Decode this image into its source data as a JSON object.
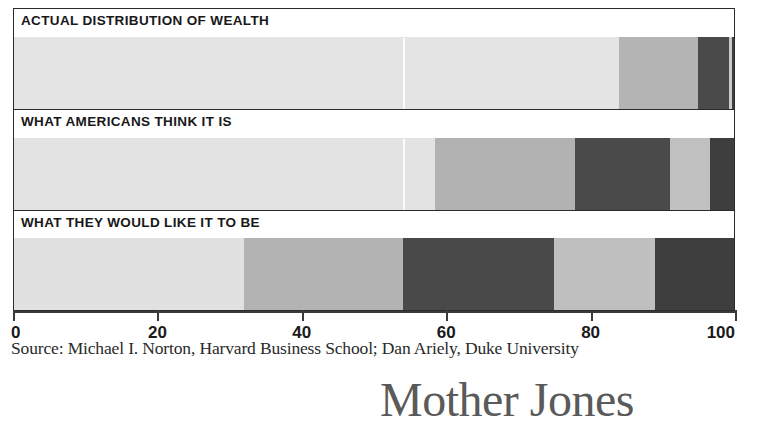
{
  "chart_data": {
    "type": "bar",
    "orientation": "horizontal",
    "stacked": true,
    "title": "",
    "xlabel": "",
    "ylabel": "",
    "xlim": [
      0,
      100
    ],
    "xticks": [
      0,
      20,
      40,
      60,
      80,
      100
    ],
    "xtick_labels": [
      "0",
      "20",
      "40",
      "60",
      "80",
      "100"
    ],
    "grid": false,
    "legend": "none",
    "categories": [
      "ACTUAL DISTRIBUTION OF WEALTH",
      "WHAT AMERICANS THINK IT IS",
      "WHAT THEY WOULD LIKE IT TO BE"
    ],
    "series": [
      {
        "name": "Top 20%",
        "values": [
          84.0,
          58.5,
          32.0
        ],
        "color": "#e3e3e3"
      },
      {
        "name": "2nd 20%",
        "values": [
          11.0,
          20.0,
          22.0
        ],
        "color": "#b6b6b6"
      },
      {
        "name": "3rd 20%",
        "values": [
          4.0,
          13.0,
          21.0
        ],
        "color": "#4a4a4a"
      },
      {
        "name": "4th 20%",
        "values": [
          0.5,
          6.0,
          14.0
        ],
        "color": "#bdbdbd"
      },
      {
        "name": "Bottom 20%",
        "values": [
          0.5,
          2.5,
          11.0
        ],
        "color": "#3f3f3f"
      }
    ],
    "source": "Source: Michael I. Norton, Harvard Business School; Dan Ariely, Duke University"
  },
  "panels": [
    {
      "label": "ACTUAL DISTRIBUTION OF WEALTH",
      "segments": [
        {
          "width": 84.0,
          "color": "#e4e4e4"
        },
        {
          "width": 11.0,
          "color": "#b4b4b4"
        },
        {
          "width": 4.3,
          "color": "#4a4a4a"
        },
        {
          "width": 0.4,
          "color": "#c9c9c9"
        },
        {
          "width": 0.3,
          "color": "#3f3f3f"
        }
      ],
      "scanline_at": 54
    },
    {
      "label": "WHAT AMERICANS THINK IT IS",
      "segments": [
        {
          "width": 58.5,
          "color": "#e3e3e3"
        },
        {
          "width": 19.4,
          "color": "#b2b2b2"
        },
        {
          "width": 13.2,
          "color": "#4a4a4a"
        },
        {
          "width": 5.6,
          "color": "#c0c0c0"
        },
        {
          "width": 3.3,
          "color": "#3e3e3e"
        }
      ],
      "scanline_at": 54
    },
    {
      "label": "WHAT THEY WOULD LIKE IT TO BE",
      "segments": [
        {
          "width": 32.0,
          "color": "#e1e1e1"
        },
        {
          "width": 22.0,
          "color": "#b3b3b3"
        },
        {
          "width": 21.0,
          "color": "#494949"
        },
        {
          "width": 14.0,
          "color": "#bfbfbf"
        },
        {
          "width": 11.0,
          "color": "#3e3e3e"
        }
      ],
      "scanline_at": null
    }
  ],
  "axis": {
    "ticks": [
      {
        "value": 0,
        "label": "0"
      },
      {
        "value": 20,
        "label": "20"
      },
      {
        "value": 40,
        "label": "40"
      },
      {
        "value": 60,
        "label": "60"
      },
      {
        "value": 80,
        "label": "80"
      },
      {
        "value": 100,
        "label": "100"
      }
    ]
  },
  "source_note": "Source: Michael I. Norton, Harvard Business School; Dan Ariely, Duke University",
  "brand": {
    "name": "Mother Jones"
  },
  "colors": {
    "segment_lightest": "#e4e4e4",
    "segment_light": "#b4b4b4",
    "segment_dark": "#4a4a4a",
    "segment_mid": "#c0c0c0",
    "segment_darkest": "#3e3e3e",
    "axis": "#3a3a3a",
    "text": "#1a1a1a",
    "brand_gray": "#5a5a5a"
  }
}
